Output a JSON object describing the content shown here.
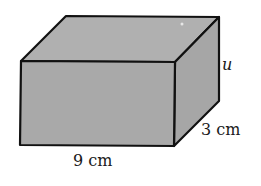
{
  "figure": {
    "type": "rectangular-prism",
    "colors": {
      "face": "#a9a9a9",
      "top": "#b0b0b0",
      "side": "#a6a6a6",
      "edge": "#111111",
      "background": "#ffffff"
    }
  },
  "labels": {
    "length": "9 cm",
    "depth": "3 cm",
    "height": "u"
  }
}
